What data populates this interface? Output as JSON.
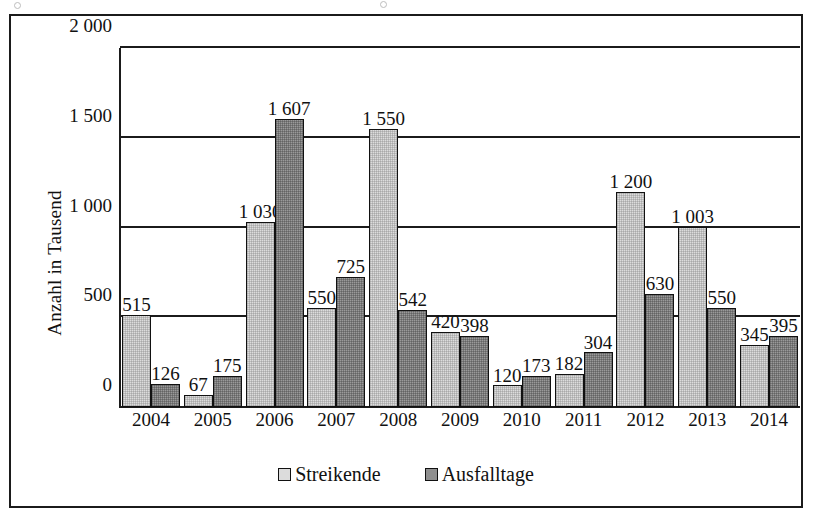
{
  "chart_data": {
    "type": "bar",
    "title": "",
    "xlabel": "",
    "ylabel": "Anzahl in Tausend",
    "ylim": [
      0,
      2000
    ],
    "yticks": [
      "0",
      "500",
      "1 000",
      "1 500",
      "2 000"
    ],
    "ytick_values": [
      0,
      500,
      1000,
      1500,
      2000
    ],
    "grid": true,
    "legend_position": "bottom",
    "categories": [
      "2004",
      "2005",
      "2006",
      "2007",
      "2008",
      "2009",
      "2010",
      "2011",
      "2012",
      "2013",
      "2014"
    ],
    "series": [
      {
        "name": "Streikende",
        "color": "#dcdcdc",
        "values": [
          515,
          67,
          1030,
          550,
          1550,
          420,
          120,
          182,
          1200,
          1003,
          345
        ],
        "labels": [
          "515",
          "67",
          "1 030",
          "550",
          "1 550",
          "420",
          "120",
          "182",
          "1 200",
          "1 003",
          "345"
        ]
      },
      {
        "name": "Ausfalltage",
        "color": "#8f8f8f",
        "values": [
          126,
          175,
          1607,
          725,
          542,
          398,
          173,
          304,
          630,
          550,
          395
        ],
        "labels": [
          "126",
          "175",
          "1 607",
          "725",
          "542",
          "398",
          "173",
          "304",
          "630",
          "550",
          "395"
        ]
      }
    ]
  },
  "legend": {
    "items": [
      {
        "label": "Streikende",
        "swatch": "light-gray-swatch"
      },
      {
        "label": "Ausfalltage",
        "swatch": "dark-gray-swatch"
      }
    ]
  }
}
